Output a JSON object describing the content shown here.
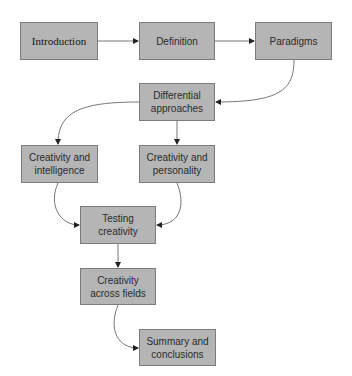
{
  "diagram": {
    "colors": {
      "box_fill": "#b5b5b5",
      "box_border": "#7c7c7c",
      "edge": "#555555",
      "text": "#2a2a2a"
    },
    "nodes": [
      {
        "id": "introduction",
        "label": "Introduction"
      },
      {
        "id": "definition",
        "label": "Definition"
      },
      {
        "id": "paradigms",
        "label": "Paradigms"
      },
      {
        "id": "differential",
        "label": "Differential\napproaches"
      },
      {
        "id": "intelligence",
        "label": "Creativity and\nintelligence"
      },
      {
        "id": "personality",
        "label": "Creativity and\npersonality"
      },
      {
        "id": "testing",
        "label": "Testing\ncreativity"
      },
      {
        "id": "fields",
        "label": "Creativity\nacross fields"
      },
      {
        "id": "summary",
        "label": "Summary and\nconclusions"
      }
    ],
    "edges": [
      {
        "from": "introduction",
        "to": "definition"
      },
      {
        "from": "definition",
        "to": "paradigms"
      },
      {
        "from": "paradigms",
        "to": "differential"
      },
      {
        "from": "differential",
        "to": "intelligence"
      },
      {
        "from": "differential",
        "to": "personality"
      },
      {
        "from": "intelligence",
        "to": "testing"
      },
      {
        "from": "personality",
        "to": "testing"
      },
      {
        "from": "testing",
        "to": "fields"
      },
      {
        "from": "fields",
        "to": "summary"
      }
    ]
  }
}
